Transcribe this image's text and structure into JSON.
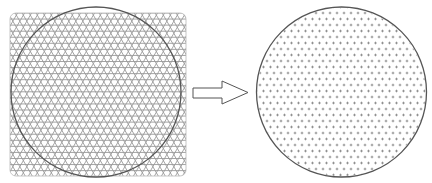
{
  "diagram": {
    "colors": {
      "background": "#ffffff",
      "mesh_line": "#9a9a9a",
      "circle_stroke": "#555555",
      "square_border": "#b8b8b8",
      "node_marker": "#8a8a8a",
      "arrow_stroke": "#555555",
      "arrow_fill": "#ffffff"
    },
    "left_panel": {
      "name": "full-square-triangular-mesh",
      "square": {
        "x": 10,
        "y": 13,
        "width": 176,
        "height": 163,
        "corner_radius": 6
      },
      "mesh_spacing": 7,
      "circle": {
        "cx": 96,
        "cy": 92,
        "r": 85
      }
    },
    "arrow": {
      "direction": "right",
      "shaft": {
        "x1": 193,
        "x2": 222,
        "y_top": 88,
        "y_bottom": 98
      },
      "head": {
        "x_base": 222,
        "x_tip": 248,
        "y_top": 81,
        "y_bottom": 104
      }
    },
    "right_panel": {
      "name": "circular-node-cloud",
      "circle": {
        "cx": 341.5,
        "cy": 92,
        "r": 85
      },
      "marker": "+",
      "spacing_x": 7,
      "spacing_y": 6
    }
  }
}
